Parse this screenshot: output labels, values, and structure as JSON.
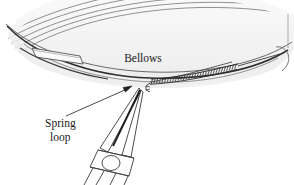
{
  "figure": {
    "background_color": "#ffffff",
    "line_color": "#3a3a3a",
    "fill_light": "#f2f2f2",
    "fill_lighter": "#f8f8f8",
    "text_color": "#1a1a1a",
    "width": 294,
    "height": 185
  },
  "labels": {
    "bellows": "Bellows",
    "spring_loop_line1": "Spring",
    "spring_loop_line2": "loop"
  },
  "parts": {
    "bellows_name": "bellows",
    "spring_name": "coiled spring",
    "pliers_name": "needle-nose pliers",
    "slot_name": "bellows slot",
    "arrow_name": "callout arrow",
    "leader_name": "callout leader line"
  }
}
